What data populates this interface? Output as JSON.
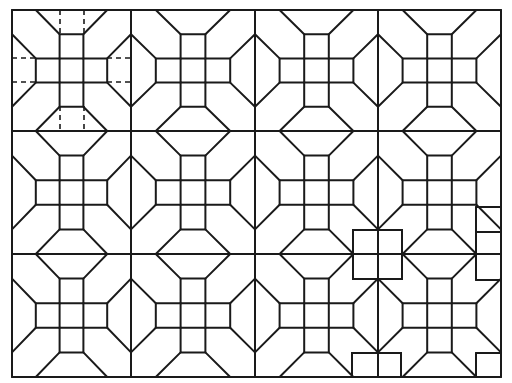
{
  "figure": {
    "title": "",
    "type": "geometric-tile-pattern",
    "stroke_color": "#1a1a1a",
    "background": "#ffffff"
  },
  "grid": {
    "columns": 4,
    "rows": 3,
    "x": [
      12,
      131,
      255,
      378,
      501
    ],
    "y": [
      10,
      131,
      254,
      377
    ]
  },
  "motif": {
    "name": "cross-with-hexagon-corners",
    "arm_outer_ratio": 0.2,
    "arm_inner_ratio": 0.4
  },
  "dashed_lines": [
    [
      60,
      10,
      60,
      34
    ],
    [
      84,
      10,
      84,
      34
    ],
    [
      60,
      106,
      60,
      131
    ],
    [
      84,
      106,
      84,
      131
    ],
    [
      12,
      58,
      36,
      58
    ],
    [
      12,
      82,
      36,
      82
    ],
    [
      107,
      58,
      131,
      58
    ],
    [
      107,
      82,
      131,
      82
    ]
  ],
  "extra_shapes": {
    "rects": [
      [
        353,
        230,
        402,
        279
      ],
      [
        352,
        353,
        401,
        377
      ]
    ],
    "lines": [
      [
        476,
        207,
        501,
        207
      ],
      [
        476,
        207,
        476,
        280
      ],
      [
        476,
        232,
        501,
        232
      ],
      [
        476,
        280,
        501,
        280
      ],
      [
        476,
        353,
        501,
        353
      ],
      [
        476,
        353,
        476,
        377
      ]
    ]
  }
}
